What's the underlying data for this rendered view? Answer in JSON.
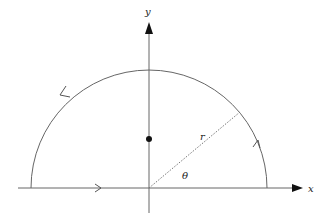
{
  "diagram": {
    "type": "semicircular contour in the complex plane",
    "axes": {
      "x_label": "x",
      "y_label": "y"
    },
    "labels": {
      "radius": "r",
      "angle": "θ"
    },
    "elements": [
      "x-axis with arrow",
      "y-axis with arrow",
      "upper semicircle arc of radius r centered at origin",
      "dotted radius line at angle θ",
      "point on positive y-axis inside the contour",
      "direction arrows along contour (counterclockwise)"
    ],
    "colors": {
      "stroke": "#555555",
      "arrowhead": "#111111",
      "point": "#111111"
    }
  }
}
